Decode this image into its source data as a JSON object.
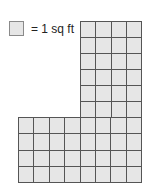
{
  "legend": {
    "label": "= 1 sq ft",
    "unit_square_color": "#e6e6e6"
  },
  "figure": {
    "shape": "L-shaped grid of unit squares",
    "upper_section": {
      "columns": 4,
      "rows": 6
    },
    "lower_section": {
      "columns": 8,
      "rows": 4
    },
    "total_unit_squares": 56,
    "grid_line_color": "#555555",
    "fill_color": "#e6e6e6"
  }
}
